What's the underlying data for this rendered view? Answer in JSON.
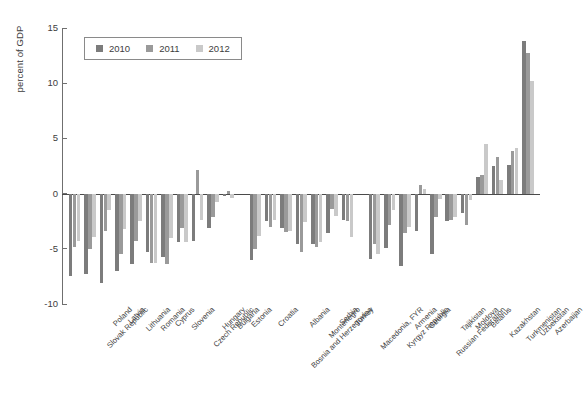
{
  "chart_data": {
    "type": "bar",
    "title": "",
    "xlabel": "",
    "ylabel": "percent of GDP",
    "ylim": [
      -10,
      15
    ],
    "yticks": [
      15,
      10,
      5,
      0,
      -5,
      -10
    ],
    "ytick_labels": [
      "15",
      "10",
      "5",
      "0",
      "-5",
      "-10"
    ],
    "grid": false,
    "legend_position": "top-left",
    "orientation": "vertical",
    "grouping": "clustered",
    "categories": [
      "Slovak Republic",
      "Poland",
      "Latvia",
      "Lithuania",
      "Romania",
      "Cyprus",
      "Slovenia",
      "Czech Republic",
      "Hungary",
      "Bulgaria",
      "Estonia",
      "Croatia",
      "Bosnia and Herzegovina",
      "Albania",
      "Montenegro",
      "Serbia",
      "Turkey",
      "Macedonia, FYR",
      "Kyrgyz Republic",
      "Armenia",
      "Georgia",
      "Russian Federation",
      "Tajikistan",
      "Moldova",
      "Belarus",
      "Kazakhstan",
      "Turkmenistan",
      "Uzbekistan",
      "Azerbaijan"
    ],
    "group_breaks": [
      11,
      18
    ],
    "series": [
      {
        "name": "2010",
        "color": "#7c7c7c",
        "values": [
          -7.5,
          -7.3,
          -8.1,
          -7.0,
          -6.4,
          -5.3,
          -5.7,
          -4.4,
          -4.3,
          -3.1,
          -0.2,
          -6.0,
          -2.5,
          -3.1,
          -4.6,
          -4.6,
          -3.6,
          -2.4,
          -5.9,
          -4.9,
          -6.6,
          -3.4,
          -5.5,
          -2.5,
          -1.8,
          1.5,
          2.5,
          2.6,
          13.8
        ]
      },
      {
        "name": "2011",
        "color": "#9a9a9a",
        "values": [
          -4.8,
          -5.0,
          -3.4,
          -5.5,
          -4.3,
          -6.3,
          -6.4,
          -3.1,
          2.1,
          -2.1,
          0.2,
          -5.0,
          -3.0,
          -3.5,
          -5.3,
          -4.8,
          -1.4,
          -2.5,
          -4.6,
          -2.8,
          -3.6,
          0.8,
          -2.1,
          -2.4,
          -2.8,
          1.7,
          3.3,
          3.9,
          12.7
        ]
      },
      {
        "name": "2012",
        "color": "#c9c9c9",
        "values": [
          -4.3,
          -3.9,
          -1.5,
          -3.2,
          -2.5,
          -6.3,
          -4.0,
          -4.4,
          -2.4,
          -0.8,
          -0.4,
          -3.8,
          -2.4,
          -3.4,
          -2.6,
          -4.4,
          -2.0,
          -3.9,
          -5.5,
          -1.5,
          -3.0,
          0.4,
          -0.5,
          -2.1,
          -0.6,
          4.5,
          1.2,
          4.1,
          10.2
        ]
      }
    ]
  },
  "legend": {
    "entries": [
      {
        "label": "2010",
        "color": "#7c7c7c"
      },
      {
        "label": "2011",
        "color": "#9a9a9a"
      },
      {
        "label": "2012",
        "color": "#c9c9c9"
      }
    ]
  },
  "axis": {
    "y_title": "percent of GDP"
  }
}
